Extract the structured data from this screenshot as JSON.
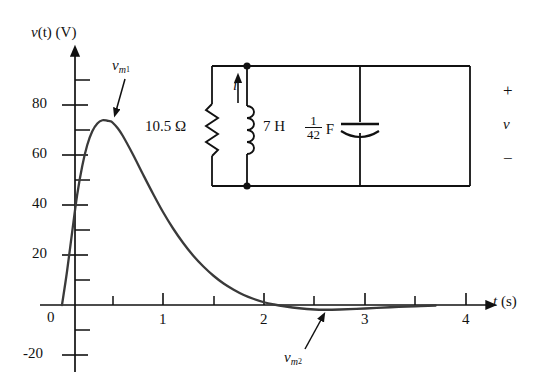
{
  "chart_data": {
    "type": "line",
    "title": "",
    "xlabel": "t (s)",
    "ylabel": "v(t) (V)",
    "xlim": [
      0,
      4.35
    ],
    "ylim": [
      -22,
      92
    ],
    "grid": false,
    "legend": null,
    "x_ticks_major": [
      1,
      2,
      3,
      4
    ],
    "x_tick_labels": [
      "1",
      "2",
      "3",
      "4"
    ],
    "x_ticks_minor": [
      0.5,
      1.5,
      2.5,
      3.5
    ],
    "y_ticks_major": [
      -20,
      0,
      20,
      40,
      60,
      80
    ],
    "y_tick_labels": [
      "-20",
      "0",
      "20",
      "40",
      "60",
      "80"
    ],
    "y_ticks_minor": [
      -10,
      10,
      30,
      50,
      70,
      90
    ],
    "series": [
      {
        "name": "v(t)",
        "color": "#3a3a3a",
        "x": [
          0.0,
          0.05,
          0.1,
          0.15,
          0.2,
          0.25,
          0.3,
          0.35,
          0.4,
          0.45,
          0.48,
          0.5,
          0.55,
          0.6,
          0.7,
          0.8,
          0.9,
          1.0,
          1.1,
          1.2,
          1.3,
          1.4,
          1.5,
          1.6,
          1.7,
          1.8,
          1.9,
          2.0,
          2.1,
          2.2,
          2.35,
          2.5,
          2.6,
          2.75,
          3.0,
          3.25,
          3.5,
          3.7
        ],
        "y": [
          0.0,
          13.5,
          29.0,
          44.0,
          55.5,
          64.0,
          69.5,
          72.6,
          73.9,
          73.7,
          73.5,
          73.0,
          70.8,
          67.8,
          60.4,
          52.4,
          44.6,
          37.2,
          30.6,
          24.8,
          19.7,
          15.4,
          11.7,
          8.6,
          6.1,
          4.0,
          2.4,
          1.1,
          0.2,
          -0.5,
          -1.3,
          -1.8,
          -1.9,
          -1.8,
          -1.4,
          -0.9,
          -0.5,
          -0.2
        ]
      }
    ],
    "annotations": [
      {
        "name": "peak-label",
        "text": "v_m1",
        "points_to_t": 0.48,
        "points_to_v": 74
      },
      {
        "name": "min-label",
        "text": "v_m2",
        "points_to_t": 2.6,
        "points_to_v": -2
      }
    ]
  },
  "axes": {
    "y_title": "v(t) (V)",
    "y_title_v": "v",
    "y_title_rest": "(t) (V)",
    "x_title_t": "t",
    "x_title_unit": "(s)",
    "y_labels": [
      "80",
      "60",
      "40",
      "20",
      "0",
      "-20"
    ],
    "x_labels": [
      "1",
      "2",
      "3",
      "4"
    ]
  },
  "annotations": {
    "peak": {
      "var": "v",
      "sub": "m",
      "subsub": "1"
    },
    "min": {
      "var": "v",
      "sub": "m",
      "subsub": "2"
    }
  },
  "circuit": {
    "name": "parallel-rlc-circuit",
    "resistor": {
      "label": "10.5 Ω",
      "value": "10.5",
      "unit": "Ω"
    },
    "inductor": {
      "label": "7 H",
      "value": "7",
      "unit": "H"
    },
    "capacitor": {
      "numerator": "1",
      "denominator": "42",
      "unit": "F"
    },
    "current": {
      "symbol": "i",
      "direction": "up"
    },
    "voltage": {
      "symbol": "v",
      "plus": "+",
      "minus": "−"
    }
  }
}
